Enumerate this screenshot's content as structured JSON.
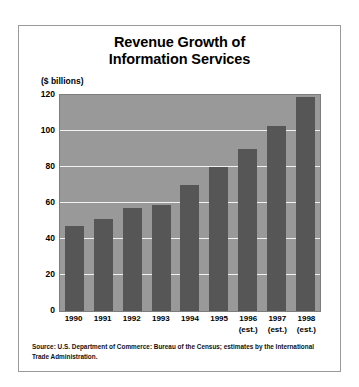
{
  "chart_data": {
    "type": "bar",
    "title": "Revenue Growth of Information Services",
    "title_lines": [
      "Revenue Growth of",
      "Information Services"
    ],
    "ylabel": "($ billions)",
    "xlabel": "",
    "categories": [
      "1990",
      "1991",
      "1992",
      "1993",
      "1994",
      "1995",
      "1996",
      "1997",
      "1998"
    ],
    "category_notes": [
      "",
      "",
      "",
      "",
      "",
      "",
      "(est.)",
      "(est.)",
      "(est.)"
    ],
    "values": [
      47,
      51,
      57,
      59,
      70,
      80,
      90,
      103,
      119
    ],
    "ylim": [
      0,
      120
    ],
    "yticks": [
      0,
      20,
      40,
      60,
      80,
      100,
      120
    ],
    "ytick_labels": [
      "0",
      "20",
      "40",
      "60",
      "80",
      "100",
      "120"
    ],
    "grid": true,
    "legend": "none",
    "bar_color": "#565656",
    "plot_background": "#999999",
    "gridline_color": "#f2f2f2"
  },
  "source": {
    "text": "Source: U.S. Department of Commerce: Bureau of the Census; estimates by the International Trade Administration."
  }
}
